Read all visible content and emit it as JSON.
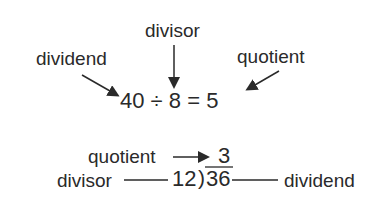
{
  "top": {
    "labels": {
      "divisor": "divisor",
      "dividend": "dividend",
      "quotient": "quotient"
    },
    "equation": {
      "dividend": "40",
      "operator": "÷",
      "divisor": "8",
      "equals": "=",
      "quotient": "5"
    }
  },
  "bottom": {
    "labels": {
      "quotient": "quotient",
      "divisor": "divisor",
      "dividend": "dividend"
    },
    "long_division": {
      "quotient": "3",
      "divisor": "12",
      "bracket": ")",
      "dividend": "36"
    }
  },
  "colors": {
    "ink": "#2a2a2a",
    "background": "#ffffff"
  }
}
